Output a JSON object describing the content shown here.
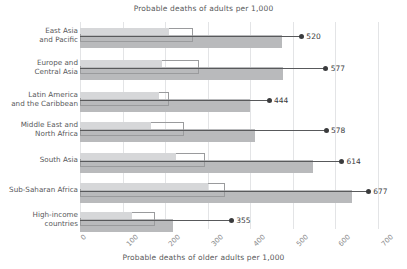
{
  "chart_data": {
    "type": "bar",
    "title": "Probable deaths of adults per 1,000",
    "xlabel": "Probable deaths of older adults per 1,000",
    "ylabel": "",
    "xlim": [
      0,
      700
    ],
    "xticks": [
      0,
      100,
      200,
      300,
      400,
      500,
      600,
      700
    ],
    "grid": true,
    "legend": "none",
    "categories": [
      "East Asia and Pacific",
      "Europe and Central Asia",
      "Latin America and the Caribbean",
      "Middle East and North Africa",
      "South Asia",
      "Sub-Saharan Africa",
      "High-income countries"
    ],
    "series": [
      {
        "name": "adults-light",
        "values": [
          210,
          193,
          185,
          167,
          225,
          300,
          123
        ]
      },
      {
        "name": "adults-hollow",
        "values": [
          265,
          280,
          210,
          245,
          293,
          340,
          175
        ]
      },
      {
        "name": "older-adults",
        "values": [
          475,
          476,
          400,
          410,
          547,
          640,
          218
        ]
      },
      {
        "name": "marker",
        "values": [
          520,
          577,
          444,
          578,
          614,
          677,
          355
        ]
      }
    ],
    "marker_labels": [
      "520",
      "577",
      "444",
      "578",
      "614",
      "677",
      "355"
    ]
  },
  "colors": {
    "light_bar": "#d6d7d9",
    "dark_bar": "#b9babc",
    "hollow_stroke": "#9a9b9d",
    "marker": "#3a3b3d",
    "grid": "#e3e4e6",
    "text": "#58595b"
  },
  "axis": {
    "tick_labels": [
      "0",
      "100",
      "200",
      "300",
      "400",
      "500",
      "600",
      "700"
    ]
  },
  "ylabels": [
    [
      "East Asia",
      "and Pacific"
    ],
    [
      "Europe and",
      "Central Asia"
    ],
    [
      "Latin America",
      "and the Caribbean"
    ],
    [
      "Middle East and",
      "North Africa"
    ],
    [
      "South Asia"
    ],
    [
      "Sub-Saharan Africa"
    ],
    [
      "High-income",
      "countries"
    ]
  ]
}
